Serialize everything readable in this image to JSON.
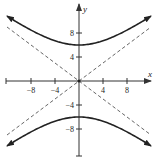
{
  "chart_data": {
    "type": "line",
    "title": "",
    "xlabel": "x",
    "ylabel": "y",
    "xlim": [
      -12,
      12
    ],
    "ylim": [
      -12,
      12
    ],
    "grid": false,
    "legend": null,
    "x_ticks": [
      -8,
      -4,
      4,
      8
    ],
    "y_ticks": [
      8,
      4,
      -4,
      -8
    ],
    "x_tick_labels": [
      "−8",
      "−4",
      "4",
      "8"
    ],
    "y_tick_labels": [
      "8",
      "4",
      "−4",
      "−8"
    ],
    "equation": "y^2/36 - x^2/64 = 1",
    "series": [
      {
        "name": "hyperbola-upper-branch",
        "style": "solid",
        "vertex": [
          0,
          6
        ],
        "x_range": [
          -12,
          12
        ]
      },
      {
        "name": "hyperbola-lower-branch",
        "style": "solid",
        "vertex": [
          0,
          -6
        ],
        "x_range": [
          -12,
          12
        ]
      },
      {
        "name": "asymptote-positive",
        "style": "dashed",
        "slope": 0.75,
        "intercept": 0,
        "x_range": [
          -12,
          12
        ]
      },
      {
        "name": "asymptote-negative",
        "style": "dashed",
        "slope": -0.75,
        "intercept": 0,
        "x_range": [
          -12,
          12
        ]
      }
    ],
    "annotations": [
      {
        "type": "point",
        "at": [
          0,
          0
        ],
        "label": ""
      }
    ]
  },
  "colors": {
    "curve": "#222222",
    "axis": "#333333",
    "asymptote": "#555555"
  }
}
